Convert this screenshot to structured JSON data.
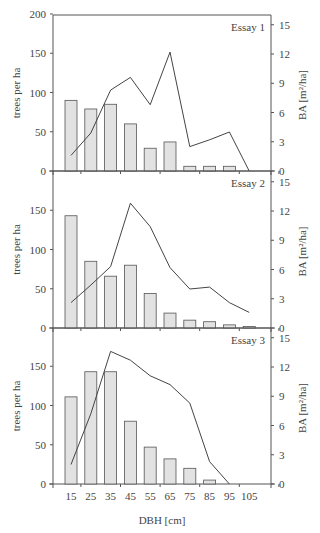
{
  "chart_data": [
    {
      "type": "bar",
      "title": "Essay 1",
      "categories": [
        "15",
        "25",
        "35",
        "45",
        "55",
        "65",
        "75",
        "85",
        "95",
        "105"
      ],
      "xlabel": "DBH [cm]",
      "ylabel": "trees per ha",
      "y2label": "BA [m²/ha]",
      "ylim": [
        0,
        200
      ],
      "yticks": [
        0,
        50,
        100,
        150,
        200
      ],
      "y2lim": [
        0,
        16.0
      ],
      "y2ticks": [
        0,
        3,
        6,
        9,
        12,
        15
      ],
      "series": [
        {
          "name": "trees per ha",
          "type": "bar",
          "axis": "left",
          "values": [
            90,
            79,
            85,
            60,
            29,
            37,
            6,
            6,
            6,
            0
          ]
        },
        {
          "name": "BA [m²/ha]",
          "type": "line",
          "axis": "right",
          "values": [
            1.6,
            3.9,
            8.3,
            9.6,
            6.8,
            12.2,
            2.5,
            3.2,
            4.0,
            0
          ]
        }
      ]
    },
    {
      "type": "bar",
      "title": "Essay 2",
      "categories": [
        "15",
        "25",
        "35",
        "45",
        "55",
        "65",
        "75",
        "85",
        "95",
        "105"
      ],
      "xlabel": "DBH [cm]",
      "ylabel": "trees per ha",
      "y2label": "BA [m²/ha]",
      "ylim": [
        0,
        200
      ],
      "yticks": [
        0,
        50,
        100,
        150
      ],
      "y2lim": [
        0,
        16.0
      ],
      "y2ticks": [
        0,
        3,
        6,
        9,
        12,
        15
      ],
      "series": [
        {
          "name": "trees per ha",
          "type": "bar",
          "axis": "left",
          "values": [
            143,
            85,
            66,
            80,
            44,
            19,
            10,
            8,
            4,
            2
          ]
        },
        {
          "name": "BA [m²/ha]",
          "type": "line",
          "axis": "right",
          "values": [
            2.6,
            4.4,
            6.3,
            12.8,
            10.4,
            6.2,
            4.0,
            4.2,
            2.6,
            1.6
          ]
        }
      ]
    },
    {
      "type": "bar",
      "title": "Essay 3",
      "categories": [
        "15",
        "25",
        "35",
        "45",
        "55",
        "65",
        "75",
        "85",
        "95",
        "105"
      ],
      "xlabel": "DBH [cm]",
      "ylabel": "trees per ha",
      "y2label": "BA [m²/ha]",
      "ylim": [
        0,
        200
      ],
      "yticks": [
        0,
        50,
        100,
        150
      ],
      "y2lim": [
        0,
        16.0
      ],
      "y2ticks": [
        0,
        3,
        6,
        9,
        12,
        15
      ],
      "series": [
        {
          "name": "trees per ha",
          "type": "bar",
          "axis": "left",
          "values": [
            111,
            143,
            143,
            80,
            47,
            32,
            20,
            5,
            0,
            0
          ]
        },
        {
          "name": "BA [m²/ha]",
          "type": "line",
          "axis": "right",
          "values": [
            2.0,
            7.2,
            13.6,
            12.7,
            11.1,
            10.2,
            8.3,
            2.3,
            0,
            null
          ]
        }
      ]
    }
  ],
  "labels": {
    "xlabel": "DBH [cm]",
    "ylabel": "trees per ha",
    "y2label": "BA [m²/ha]"
  },
  "colors": {
    "bar_fill": "#e2e2e2",
    "bar_stroke": "#555555",
    "line": "#444444",
    "axis": "#555555",
    "text": "#444444"
  }
}
